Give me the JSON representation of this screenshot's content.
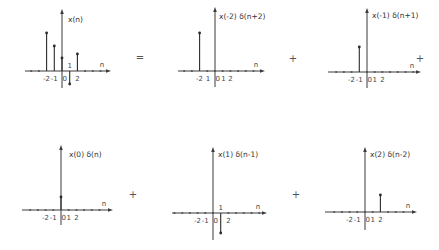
{
  "figure": {
    "operators": [
      {
        "symbol": "=",
        "x": 140,
        "y": 61
      },
      {
        "symbol": "+",
        "x": 293,
        "y": 62
      },
      {
        "symbol": "+",
        "x": 420,
        "y": 62
      },
      {
        "symbol": "+",
        "x": 133,
        "y": 198
      },
      {
        "symbol": "+",
        "x": 296,
        "y": 198
      }
    ],
    "plots": [
      {
        "id": "x-n",
        "title": "x(n)",
        "origin": [
          62,
          71
        ],
        "title_pos": [
          68,
          22
        ],
        "axis_left": 25,
        "axis_right": 108,
        "axis_top": 12,
        "axis_bottom": 88,
        "tick_spacing": 7.7,
        "tick_range": [
          -5,
          5
        ],
        "tick_labels": [
          {
            "text": "-2",
            "n": -2,
            "dy": 10
          },
          {
            "text": "-1",
            "n": -1,
            "dy": 10
          },
          {
            "text": "0",
            "n": 0.35,
            "dy": 10
          },
          {
            "text": "1",
            "n": 1,
            "dy": -3
          },
          {
            "text": "2",
            "n": 2,
            "dy": 10
          }
        ],
        "axis_var": "n",
        "stems": [
          {
            "n": -2,
            "h": 38
          },
          {
            "n": -1,
            "h": 25
          },
          {
            "n": 0,
            "h": 13
          },
          {
            "n": 1,
            "h": -13
          },
          {
            "n": 2,
            "h": 17
          }
        ]
      },
      {
        "id": "x-m2-delta",
        "title": "x(-2) δ(n+2)",
        "origin": [
          215,
          71
        ],
        "title_pos": [
          219,
          19
        ],
        "axis_left": 178,
        "axis_right": 262,
        "axis_top": 10,
        "axis_bottom": 87,
        "tick_spacing": 7.7,
        "tick_range": [
          -5,
          6
        ],
        "tick_labels": [
          {
            "text": "-2",
            "n": -2,
            "dy": 10
          },
          {
            "text": "1",
            "n": -0.9,
            "dy": 10
          },
          {
            "text": "0",
            "n": 0.35,
            "dy": 10
          },
          {
            "text": "1",
            "n": 1.1,
            "dy": 10
          },
          {
            "text": "2",
            "n": 2,
            "dy": 10
          }
        ],
        "axis_var": "n",
        "stems": [
          {
            "n": -2,
            "h": 38
          }
        ]
      },
      {
        "id": "x-m1-delta",
        "title": "x(-1) δ(n+1)",
        "origin": [
          367,
          72
        ],
        "title_pos": [
          372,
          18
        ],
        "axis_left": 328,
        "axis_right": 418,
        "axis_top": 11,
        "axis_bottom": 88,
        "tick_spacing": 7.7,
        "tick_range": [
          -4,
          6
        ],
        "tick_labels": [
          {
            "text": "-2",
            "n": -2,
            "dy": 10
          },
          {
            "text": "-1",
            "n": -1,
            "dy": 10
          },
          {
            "text": "0",
            "n": 0.35,
            "dy": 10
          },
          {
            "text": "1",
            "n": 1,
            "dy": 10
          },
          {
            "text": "2",
            "n": 2,
            "dy": 10
          }
        ],
        "axis_var": "n",
        "stems": [
          {
            "n": -1,
            "h": 25
          }
        ]
      },
      {
        "id": "x-0-delta",
        "title": "x(0) δ(n)",
        "origin": [
          61,
          210
        ],
        "title_pos": [
          69,
          157
        ],
        "axis_left": 22,
        "axis_right": 110,
        "axis_top": 148,
        "axis_bottom": 225,
        "tick_spacing": 7.7,
        "tick_range": [
          -5,
          5
        ],
        "tick_labels": [
          {
            "text": "-2",
            "n": -2,
            "dy": 10
          },
          {
            "text": "-1",
            "n": -1,
            "dy": 10
          },
          {
            "text": "0",
            "n": 0.35,
            "dy": 10
          },
          {
            "text": "1",
            "n": 1,
            "dy": 10
          },
          {
            "text": "2",
            "n": 2,
            "dy": 10
          }
        ],
        "axis_var": "n",
        "stems": [
          {
            "n": 0,
            "h": 13
          }
        ]
      },
      {
        "id": "x-1-delta",
        "title": "x(1) δ(n-1)",
        "origin": [
          213,
          213
        ],
        "title_pos": [
          218,
          157
        ],
        "axis_left": 172,
        "axis_right": 264,
        "axis_top": 150,
        "axis_bottom": 240,
        "tick_spacing": 7.7,
        "tick_range": [
          -6,
          6
        ],
        "tick_labels": [
          {
            "text": "-2",
            "n": -2,
            "dy": 10
          },
          {
            "text": "-1",
            "n": -1,
            "dy": 10
          },
          {
            "text": "0",
            "n": 0.35,
            "dy": 10
          },
          {
            "text": "1",
            "n": 1,
            "dy": -3
          },
          {
            "text": "2",
            "n": 2,
            "dy": 10
          }
        ],
        "axis_var": "n",
        "stems": [
          {
            "n": 1,
            "h": -20
          }
        ]
      },
      {
        "id": "x-2-delta",
        "title": "x(2) δ(n-2)",
        "origin": [
          365,
          212
        ],
        "title_pos": [
          370,
          157
        ],
        "axis_left": 325,
        "axis_right": 414,
        "axis_top": 150,
        "axis_bottom": 230,
        "tick_spacing": 7.7,
        "tick_range": [
          -4,
          6
        ],
        "tick_labels": [
          {
            "text": "-2",
            "n": -2,
            "dy": 10
          },
          {
            "text": "-1",
            "n": -1,
            "dy": 10
          },
          {
            "text": "0",
            "n": 0.35,
            "dy": 10
          },
          {
            "text": "1",
            "n": 1,
            "dy": 10
          },
          {
            "text": "2",
            "n": 2,
            "dy": 10
          }
        ],
        "axis_var": "n",
        "stems": [
          {
            "n": 2,
            "h": 17
          }
        ]
      }
    ]
  }
}
